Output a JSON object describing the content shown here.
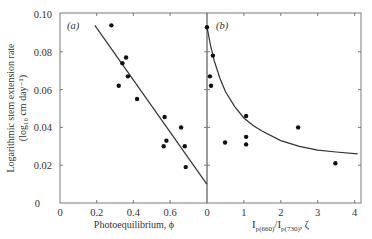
{
  "chart_data": [
    {
      "type": "scatter",
      "panel": "(a)",
      "title": "",
      "xlabel": "Photoequilibrium, ϕ",
      "ylabel": "Logarithmic stem extension rate (log10 cm day⁻¹)",
      "xlim": [
        0,
        0.8
      ],
      "ylim": [
        0,
        0.1
      ],
      "xticks": [
        0,
        0.2,
        0.4,
        0.6,
        0.8
      ],
      "xtick_labels": [
        "0",
        "0.2",
        "0.4",
        "0.6",
        ""
      ],
      "yticks": [
        0,
        0.02,
        0.04,
        0.06,
        0.08,
        0.1
      ],
      "ytick_labels": [
        "0",
        "0.02",
        "0.04",
        "0.06",
        "0.08",
        "0.10"
      ],
      "grid": false,
      "points": [
        {
          "x": 0.28,
          "y": 0.094
        },
        {
          "x": 0.32,
          "y": 0.062
        },
        {
          "x": 0.34,
          "y": 0.074
        },
        {
          "x": 0.36,
          "y": 0.077
        },
        {
          "x": 0.37,
          "y": 0.067
        },
        {
          "x": 0.42,
          "y": 0.055
        },
        {
          "x": 0.57,
          "y": 0.0455
        },
        {
          "x": 0.565,
          "y": 0.03
        },
        {
          "x": 0.58,
          "y": 0.033
        },
        {
          "x": 0.66,
          "y": 0.04
        },
        {
          "x": 0.68,
          "y": 0.03
        },
        {
          "x": 0.685,
          "y": 0.019
        }
      ],
      "fit_line": {
        "type": "linear",
        "x": [
          0.19,
          0.8
        ],
        "y": [
          0.094,
          0.01
        ]
      }
    },
    {
      "type": "scatter",
      "panel": "(b)",
      "title": "",
      "xlabel": "I p(660) / I p(730), ζ",
      "ylabel": "",
      "xlim": [
        0,
        4.2
      ],
      "ylim": [
        0,
        0.1
      ],
      "xticks": [
        0,
        1,
        2,
        3,
        4
      ],
      "xtick_labels": [
        "0",
        "1",
        "2",
        "3",
        "4"
      ],
      "grid": false,
      "points": [
        {
          "x": 0.0,
          "y": 0.093
        },
        {
          "x": 0.08,
          "y": 0.067
        },
        {
          "x": 0.11,
          "y": 0.062
        },
        {
          "x": 0.16,
          "y": 0.078
        },
        {
          "x": 0.49,
          "y": 0.032
        },
        {
          "x": 1.06,
          "y": 0.046
        },
        {
          "x": 1.06,
          "y": 0.035
        },
        {
          "x": 1.06,
          "y": 0.031
        },
        {
          "x": 2.47,
          "y": 0.04
        },
        {
          "x": 3.48,
          "y": 0.021
        }
      ],
      "fit_curve": {
        "type": "hyperbolic",
        "x": [
          0,
          0.1,
          0.2,
          0.35,
          0.5,
          0.75,
          1.0,
          1.25,
          1.5,
          2.0,
          2.5,
          3.0,
          3.5,
          4.08
        ],
        "y": [
          0.093,
          0.083,
          0.075,
          0.066,
          0.059,
          0.051,
          0.045,
          0.041,
          0.038,
          0.033,
          0.03,
          0.028,
          0.027,
          0.026
        ]
      }
    }
  ],
  "labels": {
    "panel_a": "(a)",
    "panel_b": "(b)",
    "y_title_line1": "Logarithmic stem extension rate",
    "y_title_line2": "(log₁₀ cm day⁻¹)",
    "x_title_a": "Photoequilibrium, ϕ",
    "x_title_b_I1": "I",
    "x_title_b_sub1": "p(660)",
    "x_title_b_slash": "/I",
    "x_title_b_sub2": "p(730)",
    "x_title_b_tail": ", ζ"
  },
  "colors": {
    "axis": "#7a7a7a",
    "points": "#111111",
    "fit": "#333333",
    "text": "#333333"
  }
}
